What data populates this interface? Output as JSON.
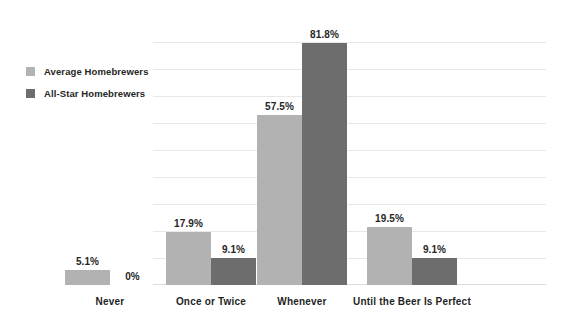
{
  "chart_data": {
    "type": "bar",
    "title": "",
    "subtitle": "",
    "xlabel": "",
    "ylabel": "",
    "ylim": [
      0,
      82
    ],
    "grid": true,
    "grid_axis": "y",
    "legend_position": "top-left",
    "categories": [
      "Never",
      "Once or Twice",
      "Whenever",
      "Until the Beer Is Perfect"
    ],
    "series": [
      {
        "name": "Average Homebrewers",
        "color": "#b2b2b2",
        "values": [
          5.1,
          17.9,
          57.5,
          19.5
        ],
        "labels": [
          "5.1%",
          "17.9%",
          "57.5%",
          "19.5%"
        ]
      },
      {
        "name": "All-Star Homebrewers",
        "color": "#6d6d6d",
        "values": [
          0,
          9.1,
          81.8,
          9.1
        ],
        "labels": [
          "0%",
          "9.1%",
          "81.8%",
          "9.1%"
        ]
      }
    ]
  },
  "legend": {
    "items": [
      {
        "label": "Average Homebrewers",
        "color": "#b2b2b2"
      },
      {
        "label": "All-Star Homebrewers",
        "color": "#6d6d6d"
      }
    ]
  },
  "colors": {
    "background": "#ffffff",
    "gridline": "#e8e8e8",
    "text": "#262626",
    "series_light": "#b2b2b2",
    "series_dark": "#6d6d6d"
  }
}
